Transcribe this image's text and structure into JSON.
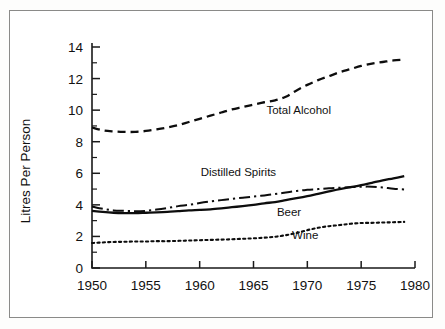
{
  "figure": {
    "name": "alcohol-consumption-line-chart",
    "border_color": "#8a8a88",
    "ink_color": "#0d0d0d",
    "background": "#ffffff"
  },
  "chart_data": {
    "type": "line",
    "title": "",
    "xlabel": "",
    "ylabel": "Litres Per Person",
    "xlim": [
      1950,
      1980
    ],
    "ylim": [
      0,
      14
    ],
    "grid": false,
    "legend_position": "inline-annotations",
    "x_ticks": [
      "1950",
      "1955",
      "1960",
      "1965",
      "1970",
      "1975",
      "1980"
    ],
    "x_tick_values": [
      1950,
      1955,
      1960,
      1965,
      1970,
      1975,
      1980
    ],
    "y_ticks": [
      "0",
      "2",
      "4",
      "6",
      "8",
      "10",
      "12",
      "14"
    ],
    "y_tick_values": [
      0,
      2,
      4,
      6,
      8,
      10,
      12,
      14
    ],
    "y_minor_ticks": [
      1,
      3,
      5,
      7,
      9,
      11,
      13
    ],
    "x": [
      1950,
      1951,
      1952,
      1953,
      1954,
      1955,
      1956,
      1957,
      1958,
      1959,
      1960,
      1961,
      1962,
      1963,
      1964,
      1965,
      1966,
      1967,
      1968,
      1969,
      1970,
      1971,
      1972,
      1973,
      1974,
      1975,
      1976,
      1977,
      1978,
      1979
    ],
    "series": [
      {
        "name": "Total Alcohol",
        "style": "dashed",
        "label_x": 1969.2,
        "label_y": 10.0,
        "values": [
          8.9,
          8.72,
          8.65,
          8.62,
          8.62,
          8.68,
          8.78,
          8.9,
          9.05,
          9.25,
          9.45,
          9.65,
          9.85,
          10.05,
          10.2,
          10.35,
          10.5,
          10.62,
          10.85,
          11.25,
          11.6,
          11.9,
          12.15,
          12.4,
          12.6,
          12.8,
          12.95,
          13.05,
          13.15,
          13.2
        ]
      },
      {
        "name": "Distilled Spirits",
        "style": "dash-dot",
        "label_x": 1963.6,
        "label_y": 6.05,
        "values": [
          3.9,
          3.75,
          3.65,
          3.62,
          3.6,
          3.62,
          3.7,
          3.8,
          3.92,
          4.0,
          4.12,
          4.22,
          4.3,
          4.38,
          4.45,
          4.52,
          4.6,
          4.68,
          4.78,
          4.88,
          4.95,
          5.0,
          5.05,
          5.08,
          5.12,
          5.15,
          5.15,
          5.1,
          5.02,
          4.98
        ]
      },
      {
        "name": "Beer",
        "style": "solid",
        "label_x": 1968.3,
        "label_y": 3.55,
        "values": [
          3.62,
          3.55,
          3.5,
          3.48,
          3.48,
          3.5,
          3.52,
          3.55,
          3.6,
          3.65,
          3.68,
          3.72,
          3.78,
          3.85,
          3.92,
          4.0,
          4.1,
          4.18,
          4.3,
          4.42,
          4.55,
          4.7,
          4.85,
          5.0,
          5.12,
          5.25,
          5.4,
          5.55,
          5.68,
          5.82
        ]
      },
      {
        "name": "Wine",
        "style": "dotted",
        "label_x": 1969.8,
        "label_y": 2.1,
        "values": [
          1.58,
          1.62,
          1.65,
          1.66,
          1.68,
          1.68,
          1.7,
          1.7,
          1.72,
          1.74,
          1.76,
          1.78,
          1.8,
          1.82,
          1.85,
          1.88,
          1.92,
          1.98,
          2.08,
          2.22,
          2.4,
          2.55,
          2.65,
          2.72,
          2.8,
          2.85,
          2.86,
          2.88,
          2.9,
          2.92
        ]
      }
    ]
  }
}
